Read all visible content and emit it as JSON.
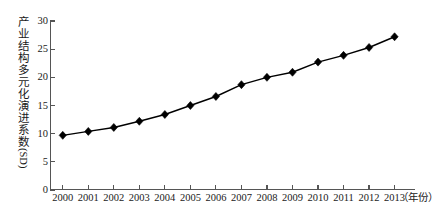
{
  "chart_data": {
    "type": "line",
    "title": "",
    "xlabel": "（年份）",
    "ylabel": "产业结构多元化演进系数",
    "ylabel_unit": "(SD)",
    "xlim": [
      1999.5,
      2013.8
    ],
    "ylim": [
      0,
      30
    ],
    "ytick_values": [
      0,
      5,
      10,
      15,
      20,
      25,
      30
    ],
    "ytick_labels": [
      "0",
      "5",
      "10",
      "15",
      "20",
      "25",
      "30"
    ],
    "grid": false,
    "legend": "none",
    "marker": "diamond",
    "line_color": "#000000",
    "marker_color": "#000000",
    "axis_color": "#555555",
    "background": "#ffffff",
    "categories": [
      "2000",
      "2001",
      "2002",
      "2003",
      "2004",
      "2005",
      "2006",
      "2007",
      "2008",
      "2009",
      "2010",
      "2011",
      "2012",
      "2013"
    ],
    "values": [
      9.7,
      10.4,
      11.1,
      12.2,
      13.4,
      15.0,
      16.6,
      18.7,
      20.0,
      20.9,
      22.7,
      23.9,
      25.3,
      27.2
    ]
  }
}
